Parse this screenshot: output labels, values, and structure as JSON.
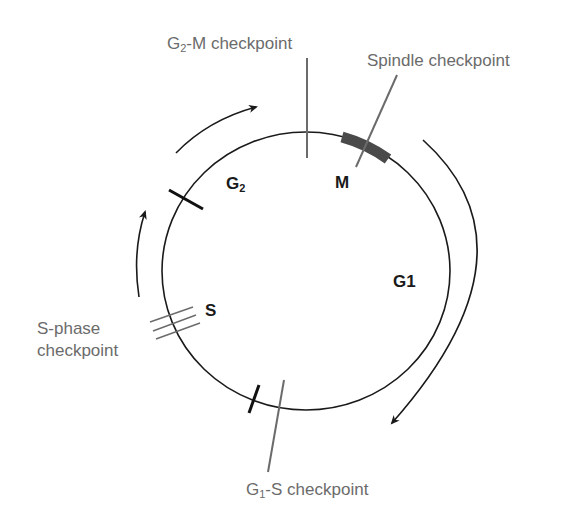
{
  "diagram": {
    "colors": {
      "cycle_line": "#1a1a1a",
      "checkpoint_line": "#6b6b6b",
      "m_block": "#4a4a4a",
      "label_gray": "#6b6b6b",
      "label_dark": "#1a1a1a"
    },
    "phases": {
      "g2": {
        "main": "G",
        "sub": "2"
      },
      "m": "M",
      "g1": "G1",
      "s": "S"
    },
    "checkpoints": {
      "g2m": {
        "pre": "G",
        "sub": "2",
        "post": "-M checkpoint"
      },
      "spindle": "Spindle checkpoint",
      "sphase_line1": "S-phase",
      "sphase_line2": "checkpoint",
      "g1s": {
        "pre": "G",
        "sub": "1",
        "post": "-S checkpoint"
      }
    },
    "arrows": [
      "clockwise-arrow-left",
      "clockwise-arrow-top-left",
      "clockwise-arrow-right"
    ]
  }
}
